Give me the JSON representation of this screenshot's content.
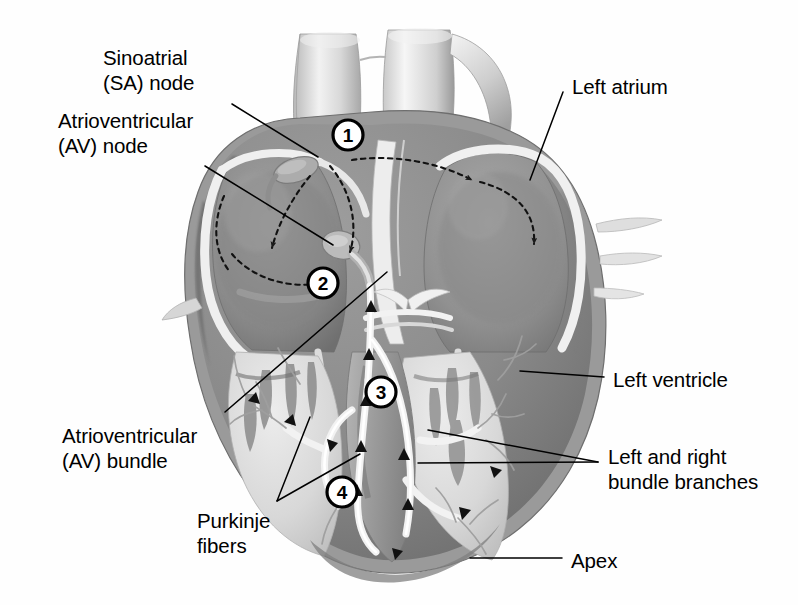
{
  "figure": {
    "style": "grayscale anatomical illustration, frontal coronal section",
    "background_color": "#ffffff",
    "ink_color": "#000000"
  },
  "labels": [
    {
      "id": "sa-node",
      "text": "Sinoatrial\n(SA) node",
      "x": 103,
      "y": 45,
      "align": "left"
    },
    {
      "id": "av-node",
      "text": "Atrioventricular\n(AV) node",
      "x": 58,
      "y": 108,
      "align": "left"
    },
    {
      "id": "av-bundle",
      "text": "Atrioventricular\n(AV) bundle",
      "x": 62,
      "y": 423,
      "align": "left"
    },
    {
      "id": "purkinje",
      "text": "Purkinje\nfibers",
      "x": 197,
      "y": 508,
      "align": "left"
    },
    {
      "id": "left-atrium",
      "text": "Left atrium",
      "x": 572,
      "y": 74,
      "align": "left"
    },
    {
      "id": "left-ventricle",
      "text": "Left ventricle",
      "x": 613,
      "y": 367,
      "align": "left"
    },
    {
      "id": "bundle-branches",
      "text": "Left and right\nbundle branches",
      "x": 608,
      "y": 444,
      "align": "left"
    },
    {
      "id": "apex",
      "text": "Apex",
      "x": 571,
      "y": 548,
      "align": "left"
    }
  ],
  "callouts": [
    {
      "id": "1",
      "label": "1",
      "cx": 348,
      "cy": 135,
      "r": 15,
      "meaning": "SA node fires, impulse spreads across atria"
    },
    {
      "id": "2",
      "label": "2",
      "cx": 323,
      "cy": 283,
      "r": 15,
      "meaning": "Impulse reaches AV node and is delayed"
    },
    {
      "id": "3",
      "label": "3",
      "cx": 381,
      "cy": 392,
      "r": 15,
      "meaning": "Impulse travels down AV bundle and bundle branches"
    },
    {
      "id": "4",
      "label": "4",
      "cx": 342,
      "cy": 492,
      "r": 15,
      "meaning": "Purkinje fibers distribute impulse through ventricles"
    }
  ],
  "leader_lines": [
    {
      "id": "sa-node-leader",
      "points": "232,104 318,157"
    },
    {
      "id": "av-node-leader",
      "points": "205,166 333,245"
    },
    {
      "id": "av-bundle-leader",
      "points": "225,412 387,272"
    },
    {
      "id": "purkinje-leader-a",
      "points": "277,501 310,417"
    },
    {
      "id": "purkinje-leader-b",
      "points": "277,501 360,454"
    },
    {
      "id": "left-atrium-leader",
      "points": "563,92 530,180"
    },
    {
      "id": "left-ventricle-leader",
      "points": "604,377 520,371"
    },
    {
      "id": "bundle-branch-leader-a",
      "points": "598,462 428,430"
    },
    {
      "id": "bundle-branch-leader-b",
      "points": "598,462 418,463"
    },
    {
      "id": "apex-leader",
      "points": "562,558 470,558"
    }
  ],
  "conduction_path": {
    "style": "dotted arrows tracing impulse spread",
    "arrows": [
      {
        "id": "sa-to-right-atrium",
        "desc": "SA node down-left into right atrium wall"
      },
      {
        "id": "sa-to-av-arc",
        "desc": "arc from SA node curving down to AV node"
      },
      {
        "id": "sa-to-left-atrium",
        "desc": "horizontal across septum into left atrium"
      },
      {
        "id": "left-atrium-sweep",
        "desc": "curving down through left atrium"
      },
      {
        "id": "av-inflow",
        "desc": "left-to-right arrow entering AV node"
      }
    ]
  }
}
